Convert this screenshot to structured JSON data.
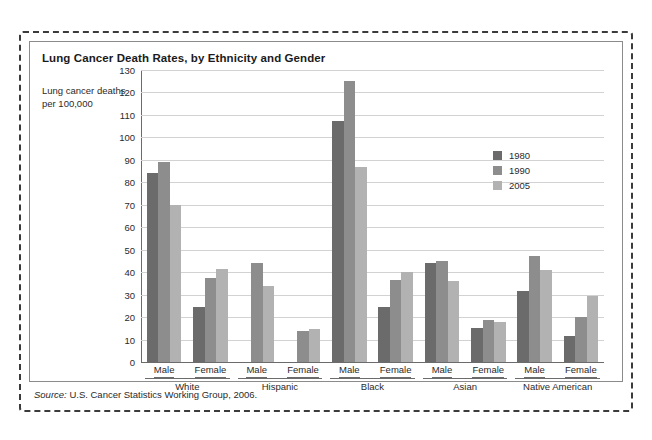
{
  "figure": {
    "title": "Lung Cancer Death Rates, by Ethnicity and Gender",
    "y_axis_title": "Lung cancer deaths per 100,000",
    "source_prefix": "Source:",
    "source_text": " U.S. Cancer Statistics Working Group, 2006."
  },
  "colors": {
    "series_1980": "#6b6b6b",
    "series_1990": "#8d8d8d",
    "series_2005": "#b2b2b2",
    "grid": "#d2d2d2",
    "axis": "#6b6b6b",
    "frame": "#3b3b3b",
    "text": "#2a2a2a"
  },
  "legend": {
    "position": "right",
    "entries": [
      {
        "label": "1980",
        "color": "#6b6b6b"
      },
      {
        "label": "1990",
        "color": "#8d8d8d"
      },
      {
        "label": "2005",
        "color": "#b2b2b2"
      }
    ]
  },
  "chart_data": {
    "type": "bar",
    "title": "Lung Cancer Death Rates, by Ethnicity and Gender",
    "xlabel": "",
    "ylabel": "Lung cancer deaths per 100,000",
    "ylim": [
      0,
      130
    ],
    "y_ticks": [
      0,
      10,
      20,
      30,
      40,
      50,
      60,
      70,
      80,
      90,
      100,
      110,
      120,
      130
    ],
    "grid": true,
    "categories": [
      "White Male",
      "White Female",
      "Hispanic Male",
      "Hispanic Female",
      "Black Male",
      "Black Female",
      "Asian Male",
      "Asian Female",
      "Native American Male",
      "Native American Female"
    ],
    "groups": [
      {
        "label": "White",
        "subcategories": [
          "Male",
          "Female"
        ]
      },
      {
        "label": "Hispanic",
        "subcategories": [
          "Male",
          "Female"
        ]
      },
      {
        "label": "Black",
        "subcategories": [
          "Male",
          "Female"
        ]
      },
      {
        "label": "Asian",
        "subcategories": [
          "Male",
          "Female"
        ]
      },
      {
        "label": "Native American",
        "subcategories": [
          "Male",
          "Female"
        ]
      }
    ],
    "series": [
      {
        "name": "1980",
        "color": "#6b6b6b",
        "values": [
          84,
          24.5,
          null,
          null,
          107.5,
          24.5,
          44,
          15,
          31.5,
          11.5
        ]
      },
      {
        "name": "1990",
        "color": "#8d8d8d",
        "values": [
          89,
          37.5,
          44,
          14,
          125,
          36.5,
          45,
          18.5,
          47,
          20
        ]
      },
      {
        "name": "2005",
        "color": "#b2b2b2",
        "values": [
          70,
          41.5,
          34,
          14.5,
          87,
          40,
          36,
          18,
          41,
          29.5
        ]
      }
    ]
  }
}
